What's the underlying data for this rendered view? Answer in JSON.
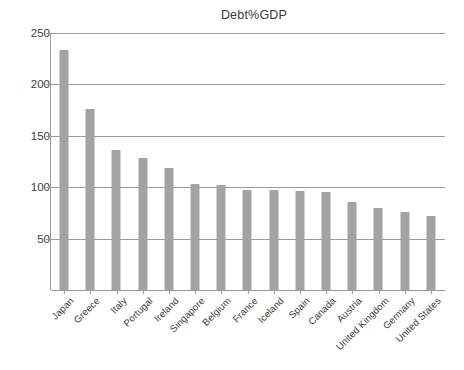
{
  "chart_data": {
    "type": "bar",
    "title": "Debt%GDP",
    "xlabel": "",
    "ylabel": "",
    "ylim": [
      0,
      250
    ],
    "yticks": [
      250,
      200,
      150,
      100,
      50
    ],
    "grid": true,
    "legend": null,
    "bar_color": "#a3a3a3",
    "axis_color": "#9a9a9a",
    "categories": [
      "Japan",
      "Greece",
      "Italy",
      "Portugal",
      "Ireland",
      "Singapore",
      "Belgium",
      "France",
      "Iceland",
      "Spain",
      "Canada",
      "Austria",
      "United Kingdom",
      "Germany",
      "United States"
    ],
    "values": [
      233,
      176,
      136,
      128,
      119,
      103,
      102,
      97,
      97,
      96,
      95,
      86,
      80,
      76,
      72
    ]
  }
}
